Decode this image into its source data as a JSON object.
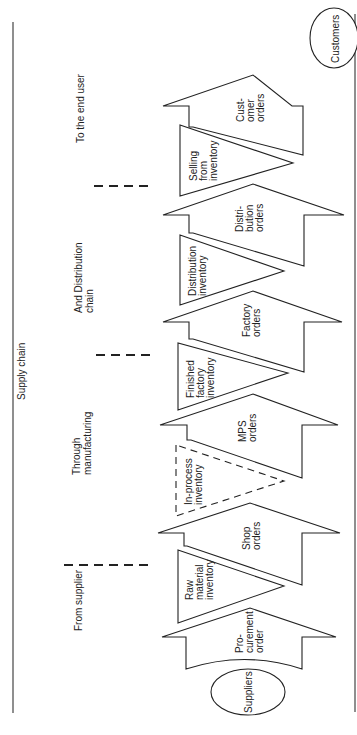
{
  "diagram": {
    "title": "Supply chain",
    "orientation": "rotated 90 degrees counter-clockwise",
    "stages": [
      {
        "label_lines": [
          "From supplier"
        ]
      },
      {
        "label_lines": [
          "Through",
          "manufacturing"
        ]
      },
      {
        "label_lines": [
          "And Distribution",
          "chain"
        ]
      },
      {
        "label_lines": [
          "To the end user"
        ]
      }
    ],
    "endpoints": {
      "start": "Suppliers",
      "end": "Customers"
    },
    "arrows": [
      {
        "label_lines": [
          "Pro-",
          "curement",
          "order"
        ]
      },
      {
        "label_lines": [
          "Shop",
          "orders"
        ]
      },
      {
        "label_lines": [
          "MPS",
          "orders"
        ]
      },
      {
        "label_lines": [
          "Factory",
          "orders"
        ]
      },
      {
        "label_lines": [
          "Distri-",
          "bution",
          "orders"
        ]
      },
      {
        "label_lines": [
          "Cust-",
          "omer",
          "orders"
        ]
      }
    ],
    "inventories": [
      {
        "label_lines": [
          "Raw",
          "material",
          "inventory"
        ],
        "style": "solid"
      },
      {
        "label_lines": [
          "In-process",
          "inventory"
        ],
        "style": "dashed"
      },
      {
        "label_lines": [
          "Finished",
          "factory",
          "inventory"
        ],
        "style": "solid"
      },
      {
        "label_lines": [
          "Distribution",
          "inventory"
        ],
        "style": "solid"
      },
      {
        "label_lines": [
          "Selling",
          "from",
          "inventory"
        ],
        "style": "solid"
      }
    ]
  }
}
